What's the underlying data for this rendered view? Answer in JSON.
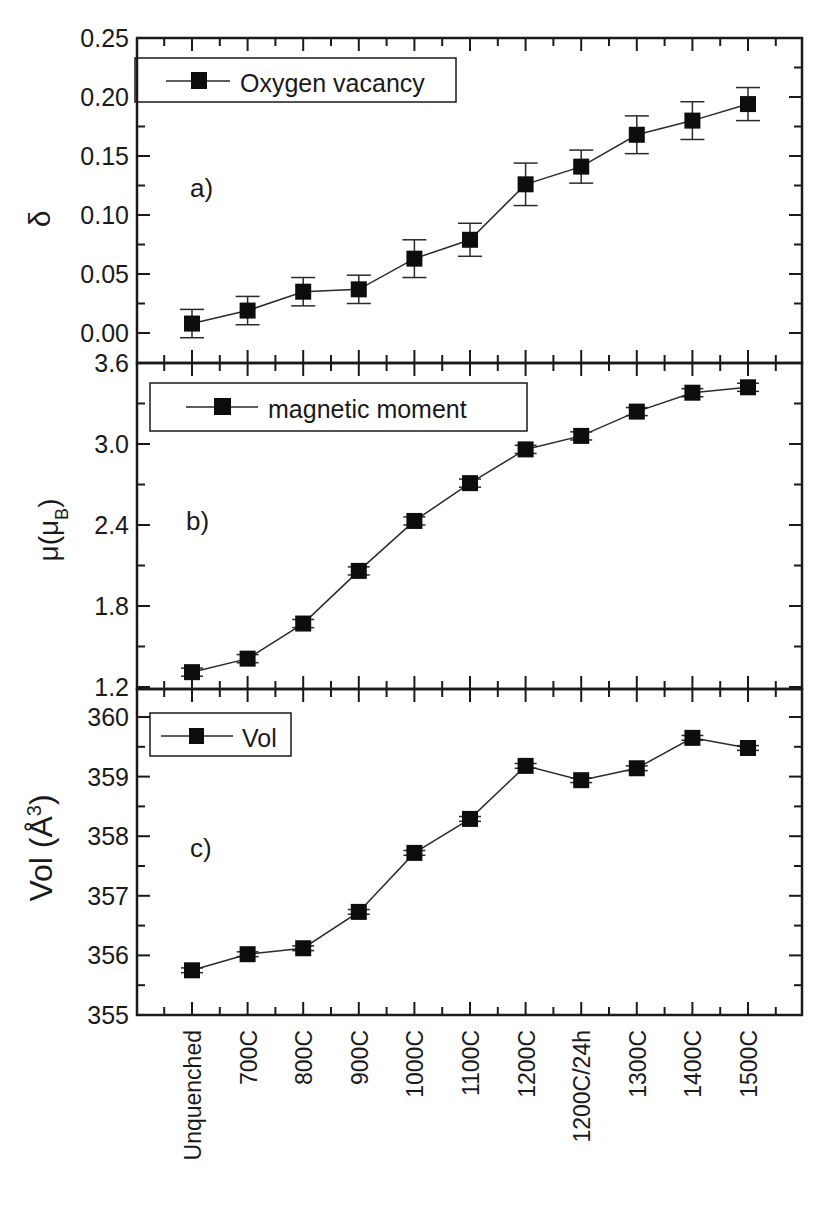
{
  "chart_data": [
    {
      "type": "line",
      "panel_label": "a)",
      "ylabel": "δ",
      "legend": "Oxygen vacancy",
      "categories": [
        "Unquenched",
        "700C",
        "800C",
        "900C",
        "1000C",
        "1100C",
        "1200C",
        "1200C/24h",
        "1300C",
        "1400C",
        "1500C"
      ],
      "values": [
        0.008,
        0.019,
        0.035,
        0.037,
        0.063,
        0.079,
        0.126,
        0.141,
        0.168,
        0.18,
        0.194
      ],
      "errors": [
        0.012,
        0.012,
        0.012,
        0.012,
        0.016,
        0.014,
        0.018,
        0.014,
        0.016,
        0.016,
        0.014
      ],
      "ylim": [
        0.0,
        0.25
      ],
      "yticks": [
        "0.00",
        "0.05",
        "0.10",
        "0.15",
        "0.20",
        "0.25"
      ],
      "ytick_values": [
        0.0,
        0.05,
        0.1,
        0.15,
        0.2,
        0.25
      ],
      "grid": false,
      "legend_position": "upper left"
    },
    {
      "type": "line",
      "panel_label": "b)",
      "ylabel": "μ(μB)",
      "legend": "magnetic moment",
      "categories": [
        "Unquenched",
        "700C",
        "800C",
        "900C",
        "1000C",
        "1100C",
        "1200C",
        "1200C/24h",
        "1300C",
        "1400C",
        "1500C"
      ],
      "values": [
        1.31,
        1.41,
        1.67,
        2.06,
        2.43,
        2.71,
        2.96,
        3.06,
        3.24,
        3.38,
        3.42
      ],
      "errors": [
        0.03,
        0.03,
        0.03,
        0.03,
        0.03,
        0.03,
        0.03,
        0.03,
        0.03,
        0.03,
        0.03
      ],
      "ylim": [
        1.2,
        3.6
      ],
      "yticks": [
        "1.2",
        "1.8",
        "2.4",
        "3.0",
        "3.6"
      ],
      "ytick_values": [
        1.2,
        1.8,
        2.4,
        3.0,
        3.6
      ],
      "grid": false,
      "legend_position": "upper left"
    },
    {
      "type": "line",
      "panel_label": "c)",
      "ylabel": "Vol (Å³)",
      "legend": "Vol",
      "categories": [
        "Unquenched",
        "700C",
        "800C",
        "900C",
        "1000C",
        "1100C",
        "1200C",
        "1200C/24h",
        "1300C",
        "1400C",
        "1500C"
      ],
      "values": [
        355.75,
        356.02,
        356.12,
        356.73,
        357.72,
        358.29,
        359.18,
        358.94,
        359.14,
        359.65,
        359.48
      ],
      "errors": [
        0.04,
        0.04,
        0.04,
        0.04,
        0.04,
        0.04,
        0.04,
        0.04,
        0.04,
        0.04,
        0.04
      ],
      "ylim": [
        355,
        360.25
      ],
      "yticks": [
        "355",
        "356",
        "357",
        "358",
        "359",
        "360"
      ],
      "ytick_values": [
        355,
        356,
        357,
        358,
        359,
        360
      ],
      "xlabel": "",
      "grid": false,
      "legend_position": "upper left"
    }
  ],
  "panels": [
    {
      "label": "a)",
      "ylabel": "δ",
      "legend": "Oxygen vacancy"
    },
    {
      "label": "b)",
      "ylabel_main": "μ(μ",
      "ylabel_sub": "B",
      "ylabel_end": ")",
      "legend": "magnetic moment"
    },
    {
      "label": "c)",
      "ylabel_main": "Vol (Å",
      "ylabel_sup": "3",
      "ylabel_end": ")",
      "legend": "Vol"
    }
  ],
  "x_axis": {
    "labels": [
      "Unquenched",
      "700C",
      "800C",
      "900C",
      "1000C",
      "1100C",
      "1200C",
      "1200C/24h",
      "1300C",
      "1400C",
      "1500C"
    ]
  },
  "colors": {
    "line": "#2a2a2a",
    "marker": "#0d0d0d",
    "axis": "#1a1a1a",
    "background": "#ffffff"
  }
}
